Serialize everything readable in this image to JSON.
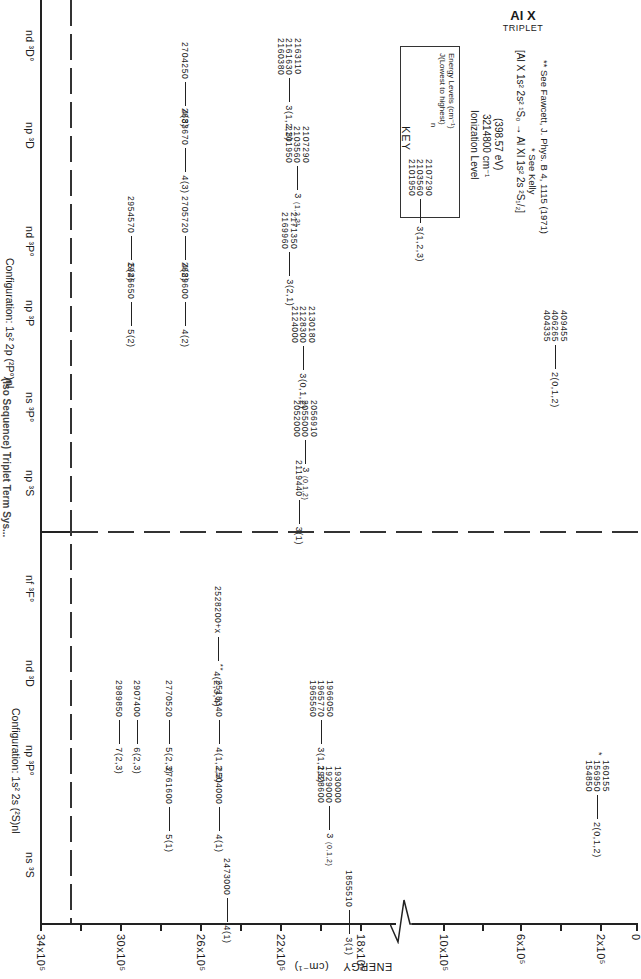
{
  "title": {
    "element": "Al X",
    "subtitle": "TRIPLET",
    "truncated_header": "(Iso Sequence) Triplet Term Sys..."
  },
  "axis": {
    "label": "ENERGY",
    "unit": "(cm⁻¹)",
    "ticks": [
      {
        "label": "34x10⁵",
        "x": 40
      },
      {
        "label": "30x10⁵",
        "x": 120
      },
      {
        "label": "26x10⁵",
        "x": 200
      },
      {
        "label": "22x10⁵",
        "x": 280
      },
      {
        "label": "18x10⁵",
        "x": 360
      },
      {
        "label": "10x10⁵",
        "x": 443
      },
      {
        "label": "6x10⁵",
        "x": 520
      },
      {
        "label": "2x10⁵",
        "x": 600
      },
      {
        "label": "0",
        "x": 636
      }
    ]
  },
  "configurations": {
    "upper": {
      "label": "Configuration: 1s² 2p (²P°)nl",
      "columns": [
        "np ³S",
        "ns ³P°",
        "np ³P",
        "nd ³P°",
        "np ³D",
        "nd ³D°"
      ]
    },
    "lower": {
      "label": "Configuration: 1s² 2s (²S)nl",
      "columns": [
        "ns ³S",
        "np ³P°",
        "nd ³D",
        "nf ³F°"
      ]
    }
  },
  "levels": {
    "upper": [
      {
        "values": [
          "2946650"
        ],
        "tag": "5(2)"
      },
      {
        "values": [
          "2954570"
        ],
        "tag": "5(2)"
      },
      {
        "values": [
          "2689600"
        ],
        "tag": "4(2)"
      },
      {
        "values": [
          "2705720"
        ],
        "tag": "4(2)"
      },
      {
        "values": [
          "2683670"
        ],
        "tag": "4(3)"
      },
      {
        "values": [
          "2704250"
        ],
        "tag": "4(3)"
      },
      {
        "values": [
          "2119440"
        ],
        "tag": "3(1)"
      },
      {
        "values": [
          "2056910",
          "2055000",
          "2052000"
        ],
        "tag": "3",
        "j": "(0,1,2)"
      },
      {
        "values": [
          "2130180",
          "2128300",
          "2124000"
        ],
        "tag": "3(0,1,2)"
      },
      {
        "values": [
          "2171350",
          "2169960"
        ],
        "tag": "3(2,1)"
      },
      {
        "values": [
          "2107290",
          "2103560",
          "2101950"
        ],
        "tag": "3",
        "j": "(1,2,3)"
      },
      {
        "values": [
          "2163110",
          "2161630",
          "2160380"
        ],
        "tag": "3(1,2,3)"
      },
      {
        "values": [
          "409455",
          "406265",
          "404335"
        ],
        "tag": "2(0,1,2)"
      }
    ],
    "lower": [
      {
        "values": [
          "2989850"
        ],
        "tag": "7(2,3)"
      },
      {
        "values": [
          "2907400"
        ],
        "tag": "6(2,3)"
      },
      {
        "values": [
          "2761600"
        ],
        "tag": "5(1)"
      },
      {
        "values": [
          "2770520"
        ],
        "tag": "5(2,3)"
      },
      {
        "values": [
          "2504000"
        ],
        "tag": "4(1)"
      },
      {
        "values": [
          "2518340"
        ],
        "tag": "4(1,2,3)"
      },
      {
        "values": [
          "2528200+x"
        ],
        "tag": "4(2,3,4)",
        "mark": "**"
      },
      {
        "values": [
          "2473000"
        ],
        "tag": "4(1)"
      },
      {
        "values": [
          "1855510"
        ],
        "tag": "3(1)"
      },
      {
        "values": [
          "1930000",
          "1929000",
          "1928600"
        ],
        "tag": "3",
        "j": "(0,1,2)"
      },
      {
        "values": [
          "1966050",
          "1965770",
          "1965560"
        ],
        "tag": "3(1,2,3)"
      },
      {
        "values": [
          "160155",
          "156950",
          "154850"
        ],
        "tag": "2(0,1,2)",
        "mark": "*"
      }
    ]
  },
  "key": {
    "heading": "KEY",
    "values": [
      "2107290",
      "2103560",
      "2101950"
    ],
    "tag": "3(1,2,3)",
    "legend": [
      "J(Lowest to highest)",
      "n",
      "Energy Levels (cm⁻¹)"
    ]
  },
  "ionization": {
    "label": "Ionization Level",
    "value": "3214800  cm⁻¹",
    "ev": "(398.57 eV)",
    "transition": "[Al X 1s² 2s² ¹S₀ → Al XI 1s² 2s ²S₁/₂]"
  },
  "notes": {
    "star": "* See Kelly",
    "double_star": "** See Fawcett, J. Phys. B 4, 1115 (1971)"
  }
}
